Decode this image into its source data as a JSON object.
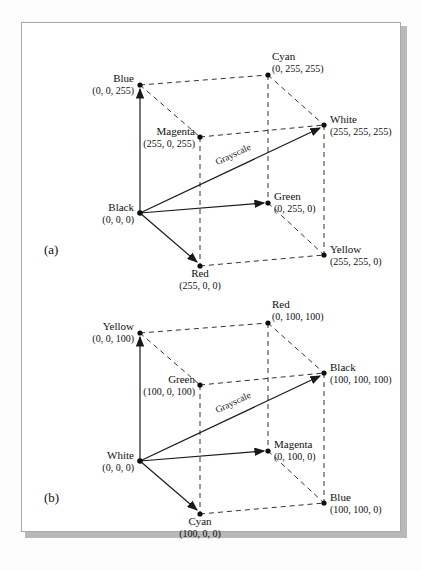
{
  "figure": {
    "type": "diagram",
    "background": "#ffffff",
    "frame_border": "#a9a9a9",
    "line_color": "#1a1a1a"
  },
  "panels": [
    {
      "tag": "(a)",
      "model": "RGB",
      "grayscale_label": "Grayscale",
      "vertices": [
        {
          "name": "Blue",
          "tuple": "(0, 0, 255)",
          "x": 118,
          "y": 62,
          "align": "left",
          "lx": 112,
          "ly": 50
        },
        {
          "name": "Cyan",
          "tuple": "(0, 255, 255)",
          "x": 246,
          "y": 52,
          "align": "right",
          "lx": 252,
          "ly": 28
        },
        {
          "name": "White",
          "tuple": "(255, 255, 255)",
          "x": 302,
          "y": 102,
          "align": "right",
          "lx": 309,
          "ly": 91
        },
        {
          "name": "Magenta",
          "tuple": "(255, 0, 255)",
          "x": 178,
          "y": 114,
          "align": "left",
          "lx": 173,
          "ly": 103
        },
        {
          "name": "Black",
          "tuple": "(0, 0, 0)",
          "x": 118,
          "y": 190,
          "align": "left",
          "lx": 112,
          "ly": 179
        },
        {
          "name": "Green",
          "tuple": "(0, 255, 0)",
          "x": 246,
          "y": 180,
          "align": "right",
          "lx": 252,
          "ly": 168
        },
        {
          "name": "Yellow",
          "tuple": "(255, 255, 0)",
          "x": 302,
          "y": 232,
          "align": "right",
          "lx": 309,
          "ly": 221
        },
        {
          "name": "Red",
          "tuple": "(255, 0, 0)",
          "x": 178,
          "y": 243,
          "align": "center",
          "lx": 178,
          "ly": 245
        }
      ]
    },
    {
      "tag": "(b)",
      "model": "CMY",
      "grayscale_label": "Grayscale",
      "vertices": [
        {
          "name": "Yellow",
          "tuple": "(0, 0, 100)",
          "x": 118,
          "y": 62,
          "align": "left",
          "lx": 112,
          "ly": 50
        },
        {
          "name": "Red",
          "tuple": "(0, 100, 100)",
          "x": 246,
          "y": 52,
          "align": "right",
          "lx": 252,
          "ly": 28
        },
        {
          "name": "Black",
          "tuple": "(100, 100, 100)",
          "x": 302,
          "y": 102,
          "align": "right",
          "lx": 309,
          "ly": 91
        },
        {
          "name": "Green",
          "tuple": "(100, 0, 100)",
          "x": 178,
          "y": 114,
          "align": "left",
          "lx": 173,
          "ly": 103
        },
        {
          "name": "White",
          "tuple": "(0, 0, 0)",
          "x": 118,
          "y": 190,
          "align": "left",
          "lx": 112,
          "ly": 179
        },
        {
          "name": "Magenta",
          "tuple": "(0, 100, 0)",
          "x": 246,
          "y": 180,
          "align": "right",
          "lx": 252,
          "ly": 168
        },
        {
          "name": "Blue",
          "tuple": "(100, 100, 0)",
          "x": 302,
          "y": 232,
          "align": "right",
          "lx": 309,
          "ly": 221
        },
        {
          "name": "Cyan",
          "tuple": "(100, 0, 0)",
          "x": 178,
          "y": 243,
          "align": "center",
          "lx": 178,
          "ly": 245
        }
      ]
    }
  ]
}
